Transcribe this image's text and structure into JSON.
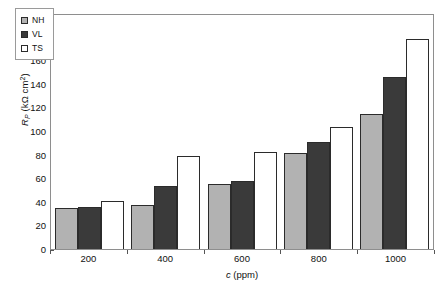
{
  "chart_data": {
    "type": "bar",
    "title": "",
    "subtitle": "",
    "categories": [
      "200",
      "400",
      "600",
      "800",
      "1000"
    ],
    "series": [
      {
        "name": "NH",
        "values": [
          35,
          37,
          55,
          81,
          114
        ],
        "color": "#b2b2b2"
      },
      {
        "name": "VL",
        "values": [
          36,
          53,
          58,
          91,
          146
        ],
        "color": "#3a3a3a"
      },
      {
        "name": "TS",
        "values": [
          41,
          79,
          82,
          103,
          178
        ],
        "color": "#ffffff"
      }
    ],
    "xlabel": "c (ppm)",
    "xlabel_symbol": "c",
    "xlabel_unit": "(ppm)",
    "ylabel": "RP (kΩ cm2)",
    "ylabel_symbol": "R",
    "ylabel_subscript": "P",
    "ylabel_unit": "(kΩ cm",
    "ylabel_superscript": "2",
    "ylabel_unit_close": ")",
    "ylim": [
      0,
      200
    ],
    "ytick_step": 20,
    "yticks": [
      "200",
      "180",
      "160",
      "140",
      "120",
      "100",
      "80",
      "60",
      "40",
      "20",
      "0"
    ],
    "grid": false,
    "legend_position": "top-left",
    "legend_entries": [
      "NH",
      "VL",
      "TS"
    ],
    "frame": true,
    "background_color": "#ffffff",
    "axis_color": "#8e8e8e",
    "bar_border_color": "#2b2b2b"
  }
}
